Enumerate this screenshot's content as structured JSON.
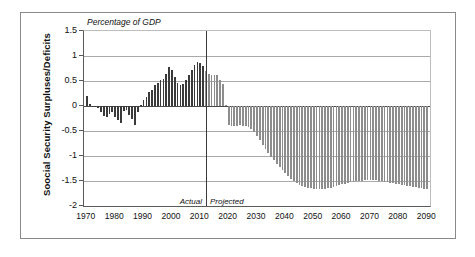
{
  "figure": {
    "plot_title": "Percentage of GDP",
    "y_axis_title": "Soocial Security Surpluses/Deficits",
    "actual_label": "Actual",
    "projected_label": "Projected",
    "colors": {
      "actual_bar": "#3a3a3a",
      "projected_bar": "#8d8d8d",
      "gridline": "#a9a9a9",
      "axis": "#5a5a5a",
      "frame": "#8a8a8a",
      "background": "#ffffff"
    }
  },
  "chart_data": {
    "type": "bar",
    "title": "Percentage of GDP",
    "xlabel": "",
    "ylabel": "Soocial Security Surpluses/Deficits",
    "ylim": [
      -2,
      1.5
    ],
    "xlim": [
      1969,
      2091
    ],
    "grid": true,
    "legend": "none",
    "y_ticks": [
      1.5,
      1,
      0.5,
      0,
      -0.5,
      -1,
      -1.5,
      -2
    ],
    "y_tick_labels": [
      "1.5",
      "1",
      "0.5",
      "0",
      "-0.5",
      "-1",
      "-1.5",
      "-2"
    ],
    "x_ticks": [
      1970,
      1980,
      1990,
      2000,
      2010,
      2020,
      2030,
      2040,
      2050,
      2060,
      2070,
      2080,
      2090
    ],
    "x_tick_labels": [
      "1970",
      "1980",
      "1990",
      "2000",
      "2010",
      "2020",
      "2030",
      "2040",
      "2050",
      "2060",
      "2070",
      "2080",
      "2090"
    ],
    "annotations": [
      {
        "text": "Actual",
        "x": 2010,
        "y": -1.82,
        "style": "italic"
      },
      {
        "text": "Projected",
        "x": 2014,
        "y": -1.82,
        "style": "italic"
      }
    ],
    "divider_x": 2012,
    "series": [
      {
        "name": "Social Security Surpluses/Deficits",
        "phase_split_year": 2012,
        "x": [
          1970,
          1971,
          1972,
          1973,
          1974,
          1975,
          1976,
          1977,
          1978,
          1979,
          1980,
          1981,
          1982,
          1983,
          1984,
          1985,
          1986,
          1987,
          1988,
          1989,
          1990,
          1991,
          1992,
          1993,
          1994,
          1995,
          1996,
          1997,
          1998,
          1999,
          2000,
          2001,
          2002,
          2003,
          2004,
          2005,
          2006,
          2007,
          2008,
          2009,
          2010,
          2011,
          2012,
          2013,
          2014,
          2015,
          2016,
          2017,
          2018,
          2019,
          2020,
          2021,
          2022,
          2023,
          2024,
          2025,
          2026,
          2027,
          2028,
          2029,
          2030,
          2031,
          2032,
          2033,
          2034,
          2035,
          2036,
          2037,
          2038,
          2039,
          2040,
          2041,
          2042,
          2043,
          2044,
          2045,
          2046,
          2047,
          2048,
          2049,
          2050,
          2051,
          2052,
          2053,
          2054,
          2055,
          2056,
          2057,
          2058,
          2059,
          2060,
          2061,
          2062,
          2063,
          2064,
          2065,
          2066,
          2067,
          2068,
          2069,
          2070,
          2071,
          2072,
          2073,
          2074,
          2075,
          2076,
          2077,
          2078,
          2079,
          2080,
          2081,
          2082,
          2083,
          2084,
          2085,
          2086,
          2087,
          2088,
          2089,
          2090
        ],
        "values": [
          0.21,
          0.05,
          0.01,
          -0.02,
          -0.04,
          -0.12,
          -0.19,
          -0.21,
          -0.16,
          -0.12,
          -0.21,
          -0.28,
          -0.33,
          -0.1,
          -0.08,
          -0.17,
          -0.25,
          -0.38,
          -0.12,
          0.02,
          0.12,
          0.18,
          0.28,
          0.33,
          0.43,
          0.46,
          0.52,
          0.55,
          0.65,
          0.78,
          0.72,
          0.58,
          0.47,
          0.42,
          0.44,
          0.52,
          0.62,
          0.72,
          0.82,
          0.88,
          0.86,
          0.8,
          0.7,
          0.64,
          0.62,
          0.63,
          0.62,
          0.52,
          0.44,
          0.03,
          -0.37,
          -0.4,
          -0.4,
          -0.39,
          -0.38,
          -0.39,
          -0.4,
          -0.42,
          -0.46,
          -0.52,
          -0.6,
          -0.68,
          -0.77,
          -0.86,
          -0.94,
          -1.01,
          -1.08,
          -1.15,
          -1.21,
          -1.28,
          -1.34,
          -1.4,
          -1.45,
          -1.5,
          -1.54,
          -1.57,
          -1.6,
          -1.62,
          -1.63,
          -1.64,
          -1.65,
          -1.65,
          -1.65,
          -1.65,
          -1.65,
          -1.64,
          -1.63,
          -1.62,
          -1.6,
          -1.58,
          -1.56,
          -1.55,
          -1.53,
          -1.52,
          -1.51,
          -1.5,
          -1.49,
          -1.49,
          -1.48,
          -1.48,
          -1.48,
          -1.48,
          -1.48,
          -1.49,
          -1.5,
          -1.51,
          -1.52,
          -1.53,
          -1.54,
          -1.55,
          -1.56,
          -1.57,
          -1.58,
          -1.59,
          -1.6,
          -1.61,
          -1.62,
          -1.63,
          -1.64,
          -1.65,
          -1.66
        ]
      }
    ]
  }
}
